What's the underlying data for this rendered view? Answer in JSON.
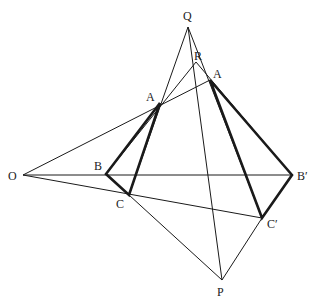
{
  "diagram": {
    "points": {
      "Q": {
        "label": "Q",
        "x": 188,
        "y": 27
      },
      "R": {
        "label": "R",
        "x": 196,
        "y": 62
      },
      "A": {
        "label": "A",
        "x": 160,
        "y": 103
      },
      "A2": {
        "label": "A",
        "x": 210,
        "y": 80
      },
      "O": {
        "label": "O",
        "x": 23,
        "y": 175
      },
      "B": {
        "label": "B",
        "x": 106,
        "y": 174
      },
      "B2": {
        "label": "B′",
        "x": 292,
        "y": 175
      },
      "C": {
        "label": "C",
        "x": 129,
        "y": 195
      },
      "C2": {
        "label": "C′",
        "x": 262,
        "y": 218
      },
      "P": {
        "label": "P",
        "x": 222,
        "y": 280
      }
    },
    "thin_lines": [
      [
        "O",
        "B2"
      ],
      [
        "O",
        "C2"
      ],
      [
        "O",
        "A2"
      ],
      [
        "Q",
        "C"
      ],
      [
        "Q",
        "C2"
      ],
      [
        "Q",
        "P"
      ],
      [
        "R",
        "B"
      ],
      [
        "R",
        "B2"
      ],
      [
        "C",
        "P"
      ],
      [
        "C2",
        "P"
      ]
    ],
    "thick_triangles": [
      [
        "A",
        "B",
        "C"
      ],
      [
        "A2",
        "B2",
        "C2"
      ]
    ],
    "colors": {
      "line": "#1a1a1a",
      "background": "#ffffff"
    }
  }
}
